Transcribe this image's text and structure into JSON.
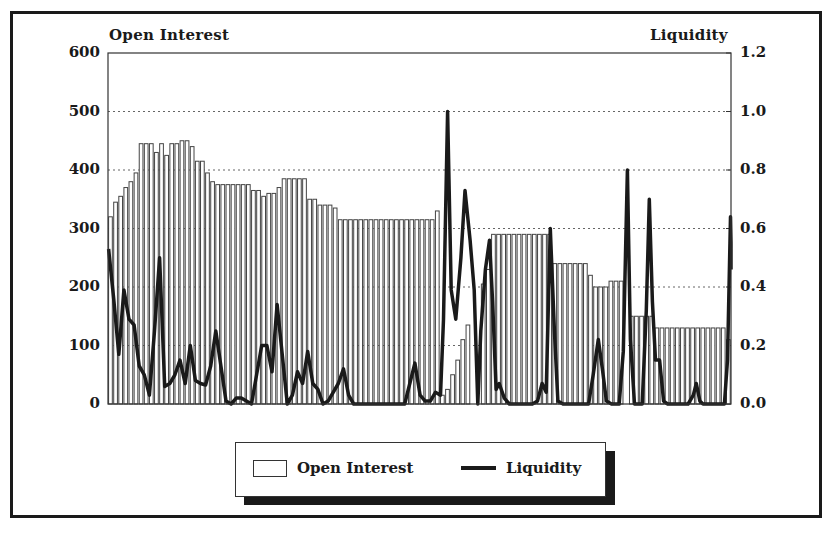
{
  "chart_data": {
    "type": "bar+line",
    "title": "",
    "left_axis_title": "Open Interest",
    "right_axis_title": "Liquidity",
    "left_ylim": [
      0,
      600
    ],
    "right_ylim": [
      0,
      1.2
    ],
    "left_ticks": [
      "600",
      "500",
      "400",
      "300",
      "200",
      "100",
      "0"
    ],
    "right_ticks": [
      "1.2",
      "1.0",
      "0.8",
      "0.6",
      "0.4",
      "0.2",
      "0.0"
    ],
    "grid": "dotted horizontal",
    "legend_position": "bottom center",
    "series": [
      {
        "name": "Open Interest",
        "type": "bar",
        "axis": "left",
        "values": [
          320,
          345,
          355,
          370,
          380,
          395,
          445,
          445,
          445,
          430,
          445,
          425,
          445,
          445,
          450,
          450,
          440,
          415,
          415,
          395,
          380,
          375,
          375,
          375,
          375,
          375,
          375,
          375,
          365,
          365,
          355,
          360,
          360,
          370,
          385,
          385,
          385,
          385,
          385,
          350,
          350,
          340,
          340,
          340,
          335,
          315,
          315,
          315,
          315,
          315,
          315,
          315,
          315,
          315,
          315,
          315,
          315,
          315,
          315,
          315,
          315,
          315,
          315,
          315,
          330,
          15,
          25,
          50,
          75,
          110,
          135,
          0,
          0,
          205,
          230,
          290,
          290,
          290,
          290,
          290,
          290,
          290,
          290,
          290,
          290,
          290,
          290,
          240,
          240,
          240,
          240,
          240,
          240,
          240,
          220,
          200,
          200,
          200,
          210,
          210,
          210,
          0,
          150,
          150,
          150,
          150,
          150,
          130,
          130,
          130,
          130,
          130,
          130,
          130,
          130,
          130,
          130,
          130,
          130,
          130,
          130,
          110
        ]
      },
      {
        "name": "Liquidity",
        "type": "line",
        "axis": "right",
        "points": [
          [
            0,
            0.53
          ],
          [
            1,
            0.36
          ],
          [
            2,
            0.17
          ],
          [
            3,
            0.39
          ],
          [
            4,
            0.29
          ],
          [
            5,
            0.27
          ],
          [
            6,
            0.13
          ],
          [
            7,
            0.1
          ],
          [
            8,
            0.03
          ],
          [
            9,
            0.25
          ],
          [
            10,
            0.5
          ],
          [
            11,
            0.06
          ],
          [
            12,
            0.07
          ],
          [
            13,
            0.1
          ],
          [
            14,
            0.15
          ],
          [
            15,
            0.07
          ],
          [
            16,
            0.2
          ],
          [
            17,
            0.08
          ],
          [
            18,
            0.07
          ],
          [
            19,
            0.065
          ],
          [
            20,
            0.13
          ],
          [
            21,
            0.25
          ],
          [
            22,
            0.13
          ],
          [
            23,
            0.01
          ],
          [
            24,
            0.0
          ],
          [
            25,
            0.02
          ],
          [
            26,
            0.02
          ],
          [
            27,
            0.01
          ],
          [
            28,
            0.0
          ],
          [
            29,
            0.1
          ],
          [
            30,
            0.2
          ],
          [
            31,
            0.2
          ],
          [
            32,
            0.11
          ],
          [
            33,
            0.34
          ],
          [
            34,
            0.17
          ],
          [
            35,
            0.0
          ],
          [
            36,
            0.03
          ],
          [
            37,
            0.11
          ],
          [
            38,
            0.07
          ],
          [
            39,
            0.18
          ],
          [
            40,
            0.07
          ],
          [
            41,
            0.05
          ],
          [
            42,
            0.0
          ],
          [
            43,
            0.01
          ],
          [
            44,
            0.04
          ],
          [
            45,
            0.07
          ],
          [
            46,
            0.12
          ],
          [
            47,
            0.03
          ],
          [
            48,
            0.0
          ],
          [
            58,
            0.0
          ],
          [
            59,
            0.07
          ],
          [
            60,
            0.14
          ],
          [
            61,
            0.03
          ],
          [
            62,
            0.01
          ],
          [
            63,
            0.01
          ],
          [
            64,
            0.04
          ],
          [
            65,
            0.03
          ],
          [
            65.6,
            0.29
          ],
          [
            66.4,
            1.0
          ],
          [
            67.1,
            0.39
          ],
          [
            68,
            0.29
          ],
          [
            69,
            0.5
          ],
          [
            69.8,
            0.73
          ],
          [
            70.8,
            0.56
          ],
          [
            71.6,
            0.39
          ],
          [
            72.3,
            0.0
          ],
          [
            72.9,
            0.25
          ],
          [
            73.8,
            0.46
          ],
          [
            74.6,
            0.56
          ],
          [
            75.2,
            0.35
          ],
          [
            75.9,
            0.05
          ],
          [
            76.5,
            0.07
          ],
          [
            77.5,
            0.02
          ],
          [
            78.5,
            0.0
          ],
          [
            83,
            0.0
          ],
          [
            84,
            0.01
          ],
          [
            84.9,
            0.07
          ],
          [
            85.7,
            0.04
          ],
          [
            86.5,
            0.6
          ],
          [
            87.3,
            0.25
          ],
          [
            88,
            0.01
          ],
          [
            89,
            0.0
          ],
          [
            94,
            0.0
          ],
          [
            94.9,
            0.1
          ],
          [
            95.9,
            0.22
          ],
          [
            96.7,
            0.12
          ],
          [
            97.5,
            0.01
          ],
          [
            98.5,
            0.0
          ],
          [
            100,
            0.0
          ],
          [
            100.8,
            0.18
          ],
          [
            101.6,
            0.8
          ],
          [
            102.2,
            0.22
          ],
          [
            103,
            0.0
          ],
          [
            104.5,
            0.0
          ],
          [
            105.3,
            0.32
          ],
          [
            105.9,
            0.7
          ],
          [
            106.5,
            0.35
          ],
          [
            107.1,
            0.15
          ],
          [
            107.9,
            0.15
          ],
          [
            108.7,
            0.01
          ],
          [
            109.5,
            0.0
          ],
          [
            113.5,
            0.0
          ],
          [
            114.5,
            0.03
          ],
          [
            115.1,
            0.07
          ],
          [
            115.8,
            0.01
          ],
          [
            116.4,
            0.0
          ],
          [
            120.6,
            0.0
          ],
          [
            121.2,
            0.15
          ],
          [
            121.8,
            0.64
          ],
          [
            122.4,
            0.55
          ],
          [
            123,
            0.46
          ]
        ]
      }
    ]
  },
  "legend": {
    "items": [
      {
        "label": "Open Interest",
        "swatch": "hollow-bar"
      },
      {
        "label": "Liquidity",
        "swatch": "thick-line"
      }
    ]
  },
  "colors": {
    "ink": "#1a1a1a",
    "bar_fill": "#ffffff",
    "bar_stroke": "#444444",
    "grid": "#666666"
  }
}
